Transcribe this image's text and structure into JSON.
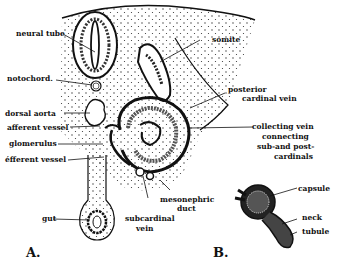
{
  "figure": {
    "panel_a": {
      "letter": "A.",
      "labels": {
        "neural_tube": "neural tube",
        "somite": "somite",
        "notochord": "notochord.",
        "posterior_cardinal_vein_1": "posterior",
        "posterior_cardinal_vein_2": "cardinal vein",
        "dorsal_aorta": "dorsal aorta",
        "afferent_vessel": "afferent vessel",
        "collecting_vein_1": "collecting  vein",
        "collecting_vein_2": "connecting",
        "collecting_vein_3": "sub-and post-",
        "collecting_vein_4": "cardinals",
        "glomerulus": "glomerulus",
        "efferent_vessel": "éfferent vessel",
        "mesonephric_duct_1": "mesonephric",
        "mesonephric_duct_2": "duct",
        "gut": "gut",
        "subcardinal_vein_1": "subcardinal",
        "subcardinal_vein_2": "vein"
      }
    },
    "panel_b": {
      "letter": "B.",
      "labels": {
        "capsule": "capsule",
        "neck": "neck",
        "tubule": "tubule"
      }
    }
  }
}
